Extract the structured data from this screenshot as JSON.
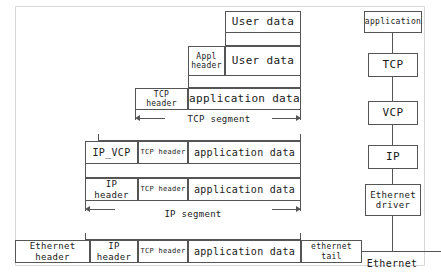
{
  "diagram": {
    "encapsulation": {
      "row_user_data": {
        "cells": [
          {
            "label": "User data"
          }
        ]
      },
      "row_appl": {
        "cells": [
          {
            "label": "Appl\nheader"
          },
          {
            "label": "User data"
          }
        ],
        "appl_header_line1": "Appl",
        "appl_header_line2": "header",
        "user_data": "User data"
      },
      "row_tcp": {
        "cells": [
          {
            "label": "TCP header"
          },
          {
            "label": "application data"
          }
        ],
        "tcp_header": "TCP header",
        "application_data": "application data"
      },
      "tcp_segment_label": "TCP segment",
      "row_ip_vcp": {
        "ip_vcp": "IP_VCP",
        "tcp_header": "TCP header",
        "application_data": "application data"
      },
      "row_ip": {
        "ip_header": "IP header",
        "tcp_header": "TCP header",
        "application_data": "application data"
      },
      "ip_segment_label": "IP segment",
      "row_ethernet": {
        "ethernet_header": "Ethernet header",
        "ip_header": "IP header",
        "tcp_header": "TCP header",
        "application_data": "application data",
        "ethernet_tail": "ethernet tail"
      }
    },
    "stack": {
      "nodes": [
        {
          "id": "application",
          "label": "application"
        },
        {
          "id": "tcp",
          "label": "TCP"
        },
        {
          "id": "vcp",
          "label": "VCP"
        },
        {
          "id": "ip",
          "label": "IP"
        },
        {
          "id": "ethernet-driver",
          "label": "Ethernet\ndriver",
          "line1": "Ethernet",
          "line2": "driver"
        }
      ],
      "bus_label": "Ethernet"
    },
    "colors": {
      "stroke": "#555555",
      "frame": "#d8d8d8",
      "background": "#ffffff",
      "text": "#1a1a1a"
    }
  }
}
